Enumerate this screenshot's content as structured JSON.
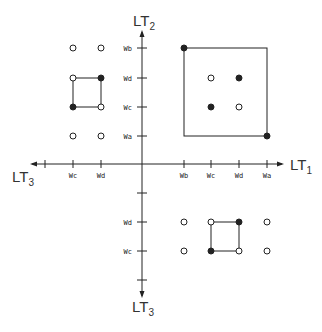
{
  "axes": {
    "x_positive": {
      "label": "LT",
      "sub": "1"
    },
    "x_negative": {
      "label": "LT",
      "sub": "3"
    },
    "y_positive": {
      "label": "LT",
      "sub": "2"
    },
    "y_negative": {
      "label": "LT",
      "sub": "3"
    }
  },
  "ticks": {
    "x_left": [
      {
        "x": 45,
        "label": ""
      },
      {
        "x": 73,
        "label": "Wc"
      },
      {
        "x": 101,
        "label": "Wd"
      }
    ],
    "x_right": [
      {
        "x": 184,
        "label": "Wb"
      },
      {
        "x": 211,
        "label": "Wc"
      },
      {
        "x": 239,
        "label": "Wd"
      },
      {
        "x": 267,
        "label": "Wa"
      }
    ],
    "y_top": [
      {
        "y": 48,
        "label": "Wb"
      },
      {
        "y": 78,
        "label": "Wd"
      },
      {
        "y": 107,
        "label": "Wc"
      },
      {
        "y": 136,
        "label": "Wa"
      }
    ],
    "y_bottom": [
      {
        "y": 193,
        "label": ""
      },
      {
        "y": 222,
        "label": "Wd"
      },
      {
        "y": 251,
        "label": "Wc"
      },
      {
        "y": 280,
        "label": ""
      }
    ]
  },
  "quadrants": {
    "upper_left": {
      "points": [
        {
          "x": 73,
          "y": 48,
          "filled": false
        },
        {
          "x": 101,
          "y": 48,
          "filled": false
        },
        {
          "x": 73,
          "y": 78,
          "filled": false
        },
        {
          "x": 101,
          "y": 78,
          "filled": true
        },
        {
          "x": 73,
          "y": 107,
          "filled": true
        },
        {
          "x": 101,
          "y": 107,
          "filled": false
        },
        {
          "x": 73,
          "y": 136,
          "filled": false
        },
        {
          "x": 101,
          "y": 136,
          "filled": false
        }
      ],
      "box": {
        "x1": 73,
        "y1": 78,
        "x2": 101,
        "y2": 107
      }
    },
    "upper_right": {
      "points": [
        {
          "x": 184,
          "y": 48,
          "filled": true
        },
        {
          "x": 211,
          "y": 78,
          "filled": false
        },
        {
          "x": 239,
          "y": 78,
          "filled": true
        },
        {
          "x": 211,
          "y": 107,
          "filled": true
        },
        {
          "x": 239,
          "y": 107,
          "filled": false
        },
        {
          "x": 267,
          "y": 136,
          "filled": true
        }
      ],
      "box": {
        "x1": 184,
        "y1": 48,
        "x2": 267,
        "y2": 136
      }
    },
    "lower_right": {
      "points": [
        {
          "x": 184,
          "y": 222,
          "filled": false
        },
        {
          "x": 211,
          "y": 222,
          "filled": false
        },
        {
          "x": 239,
          "y": 222,
          "filled": true
        },
        {
          "x": 267,
          "y": 222,
          "filled": false
        },
        {
          "x": 184,
          "y": 251,
          "filled": false
        },
        {
          "x": 211,
          "y": 251,
          "filled": true
        },
        {
          "x": 239,
          "y": 251,
          "filled": false
        },
        {
          "x": 267,
          "y": 251,
          "filled": false
        }
      ],
      "box": {
        "x1": 211,
        "y1": 222,
        "x2": 239,
        "y2": 251
      }
    }
  },
  "colors": {
    "ink": "#222222",
    "background": "#ffffff"
  }
}
